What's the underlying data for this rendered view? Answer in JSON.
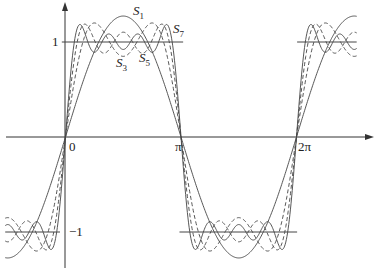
{
  "chart_data": {
    "type": "line",
    "title": "",
    "xlabel": "",
    "ylabel": "",
    "xlim": [
      -1.64,
      7.92
    ],
    "ylim": [
      -1.4,
      1.4
    ],
    "grid": false,
    "legend": "inline labels",
    "x_ticks": [
      {
        "value": 0,
        "label": "0"
      },
      {
        "value": 3.14159,
        "label": "π"
      },
      {
        "value": 6.28318,
        "label": "2π"
      }
    ],
    "y_ticks": [
      {
        "value": 1,
        "label": "1"
      },
      {
        "value": -1,
        "label": "−1"
      }
    ],
    "reference_lines": [
      {
        "y": 1,
        "x_from": -0.1,
        "x_to": 3.2
      },
      {
        "y": -1,
        "x_from": -1.64,
        "x_to": -0.15
      },
      {
        "y": -1,
        "x_from": 3.1,
        "x_to": 6.3
      },
      {
        "y": 1,
        "x_from": 6.3,
        "x_to": 7.92
      }
    ],
    "series": [
      {
        "name": "S1",
        "label": "S",
        "sub": "1",
        "terms": [
          1
        ],
        "style": "solid"
      },
      {
        "name": "S3",
        "label": "S",
        "sub": "3",
        "terms": [
          1,
          3
        ],
        "style": "dashed"
      },
      {
        "name": "S5",
        "label": "S",
        "sub": "5",
        "terms": [
          1,
          3,
          5
        ],
        "style": "dashed"
      },
      {
        "name": "S7",
        "label": "S",
        "sub": "7",
        "terms": [
          1,
          3,
          5,
          7
        ],
        "style": "solid"
      }
    ],
    "annotations": [
      {
        "text": "S1",
        "x": 1.85,
        "y": 1.3
      },
      {
        "text": "S3",
        "x": 1.45,
        "y": 0.78
      },
      {
        "text": "S5",
        "x": 2.05,
        "y": 0.82
      },
      {
        "text": "S7",
        "x": 2.9,
        "y": 1.12
      }
    ]
  },
  "labels": {
    "tick_0": "0",
    "tick_pi": "π",
    "tick_2pi": "2π",
    "tick_y1": "1",
    "tick_ym1": "−1",
    "s": "S",
    "s1": "1",
    "s3": "3",
    "s5": "5",
    "s7": "7"
  }
}
